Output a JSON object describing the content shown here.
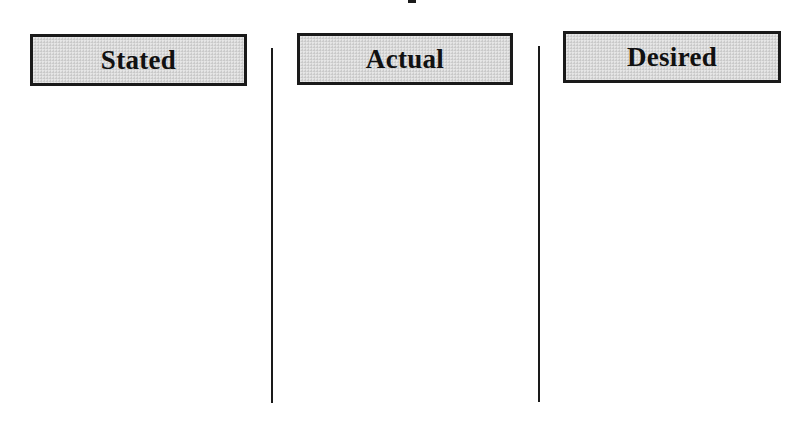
{
  "diagram": {
    "title_visible": false,
    "columns": [
      {
        "id": "stated",
        "label": "Stated",
        "items": []
      },
      {
        "id": "actual",
        "label": "Actual",
        "items": []
      },
      {
        "id": "desired",
        "label": "Desired",
        "items": []
      }
    ],
    "colors": {
      "header_fill": "#d9d9d9",
      "border": "#1a1a1a",
      "background": "#ffffff",
      "text": "#111111"
    }
  }
}
